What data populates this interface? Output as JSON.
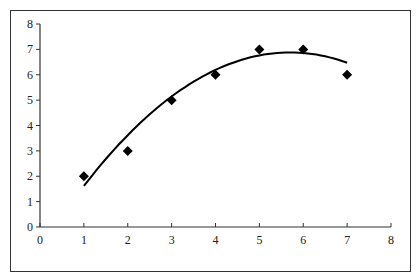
{
  "chart_data": {
    "type": "scatter",
    "title": "",
    "xlabel": "",
    "ylabel": "",
    "xlim": [
      0,
      8
    ],
    "ylim": [
      0,
      8
    ],
    "grid": false,
    "legend": null,
    "x_ticks": [
      "0",
      "1",
      "2",
      "3",
      "4",
      "5",
      "6",
      "7",
      "8"
    ],
    "y_ticks": [
      "0",
      "1",
      "2",
      "3",
      "4",
      "5",
      "6",
      "7",
      "8"
    ],
    "series": [
      {
        "name": "data",
        "marker": "diamond",
        "color": "#000000",
        "x": [
          1,
          2,
          3,
          4,
          5,
          6,
          7
        ],
        "y": [
          2,
          3,
          5,
          6,
          7,
          7,
          6
        ]
      }
    ],
    "trendline": {
      "type": "polynomial",
      "order": 2,
      "coefficients": {
        "a": -0.2381,
        "b": 2.7143,
        "c": -0.8571
      },
      "x_range": [
        1,
        7
      ],
      "color": "#000000"
    }
  }
}
